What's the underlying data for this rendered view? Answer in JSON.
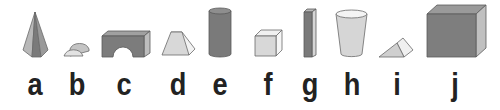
{
  "figure": {
    "colors": {
      "dark_face": "#7a7a7a",
      "mid_face": "#a8a8a8",
      "light_face": "#dcdcdc",
      "outline": "#6a6a6a",
      "label": "#222222"
    },
    "items": [
      {
        "label": "a",
        "shape": "pyramid-icon",
        "x": 35
      },
      {
        "label": "b",
        "shape": "half-cylinder-icon",
        "x": 77
      },
      {
        "label": "c",
        "shape": "arch-block-icon",
        "x": 124
      },
      {
        "label": "d",
        "shape": "trapezoid-prism-icon",
        "x": 178
      },
      {
        "label": "e",
        "shape": "cylinder-icon",
        "x": 220
      },
      {
        "label": "f",
        "shape": "cube-small-icon",
        "x": 268
      },
      {
        "label": "g",
        "shape": "tall-bar-icon",
        "x": 310
      },
      {
        "label": "h",
        "shape": "cup-icon",
        "x": 352
      },
      {
        "label": "i",
        "shape": "triangular-prism-icon",
        "x": 397
      },
      {
        "label": "j",
        "shape": "cube-large-icon",
        "x": 455
      }
    ]
  }
}
